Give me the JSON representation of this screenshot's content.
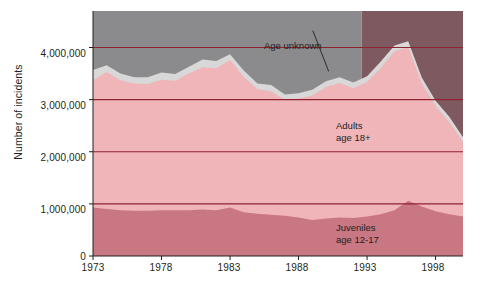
{
  "chart_data": {
    "type": "area",
    "stacked": true,
    "title": "",
    "subtitle": "",
    "xlabel": "",
    "ylabel": "Number of incidents",
    "xlim": [
      1973,
      2000
    ],
    "ylim": [
      0,
      4700000
    ],
    "grid": "horizontal",
    "legend_position": "inline-annotations",
    "x": [
      1973,
      1974,
      1975,
      1976,
      1977,
      1978,
      1979,
      1980,
      1981,
      1982,
      1983,
      1984,
      1985,
      1986,
      1987,
      1988,
      1989,
      1990,
      1991,
      1992,
      1993,
      1994,
      1995,
      1996,
      1997,
      1998,
      1999,
      2000
    ],
    "ytick_labels": [
      "0",
      "1,000,000",
      "2,000,000",
      "3,000,000",
      "4,000,000"
    ],
    "ytick_values": [
      0,
      1000000,
      2000000,
      3000000,
      4000000
    ],
    "xtick_labels": [
      "1973",
      "1978",
      "1983",
      "1988",
      "1993",
      "1998"
    ],
    "xtick_values": [
      1973,
      1978,
      1983,
      1988,
      1993,
      1998
    ],
    "series": [
      {
        "name": "Juveniles age 12-17",
        "color": "#c97782",
        "values": [
          930000,
          900000,
          880000,
          870000,
          870000,
          880000,
          880000,
          880000,
          890000,
          880000,
          930000,
          840000,
          810000,
          790000,
          770000,
          740000,
          690000,
          720000,
          740000,
          730000,
          760000,
          800000,
          880000,
          1060000,
          950000,
          860000,
          800000,
          760000
        ]
      },
      {
        "name": "Adults age 18+",
        "color": "#f0b5b9",
        "values": [
          2440000,
          2630000,
          2490000,
          2440000,
          2430000,
          2500000,
          2480000,
          2620000,
          2730000,
          2720000,
          2830000,
          2600000,
          2390000,
          2370000,
          2220000,
          2280000,
          2390000,
          2520000,
          2580000,
          2490000,
          2580000,
          2810000,
          3050000,
          2950000,
          2360000,
          2020000,
          1770000,
          1430000
        ]
      },
      {
        "name": "Age unknown",
        "color": "#d8d8d8",
        "values": [
          200000,
          130000,
          130000,
          120000,
          130000,
          140000,
          130000,
          130000,
          150000,
          140000,
          110000,
          120000,
          110000,
          120000,
          110000,
          100000,
          110000,
          110000,
          110000,
          110000,
          110000,
          120000,
          110000,
          110000,
          110000,
          100000,
          100000,
          90000
        ]
      }
    ],
    "stack_top_totals": [
      3570000,
      3660000,
      3500000,
      3430000,
      3430000,
      3520000,
      3490000,
      3630000,
      3770000,
      3740000,
      3870000,
      3560000,
      3310000,
      3280000,
      3100000,
      3120000,
      3190000,
      3350000,
      3430000,
      3330000,
      3450000,
      3730000,
      4040000,
      4120000,
      3420000,
      2980000,
      2670000,
      2280000
    ],
    "annotations": [
      {
        "text": "Age unknown",
        "x": 1987.0,
        "y": 4400000,
        "leader_to_x": 1990.2,
        "leader_to_y": 3540000
      },
      {
        "text_line1": "Adults",
        "text_line2": "age 18+",
        "x": 1993.3,
        "y": 2600000
      },
      {
        "text_line1": "Juveniles",
        "text_line2": "age 12-17",
        "x": 1993.3,
        "y": 550000
      }
    ],
    "background_panels": [
      {
        "name": "left-panel",
        "color": "#8b8b8d",
        "from_x": 1973,
        "to_x": 1992.6
      },
      {
        "name": "right-panel",
        "color": "#7e5a60",
        "from_x": 1992.6,
        "to_x": 2000
      }
    ],
    "gridline_color": "#8e2332",
    "axis_color": "#231f20"
  }
}
